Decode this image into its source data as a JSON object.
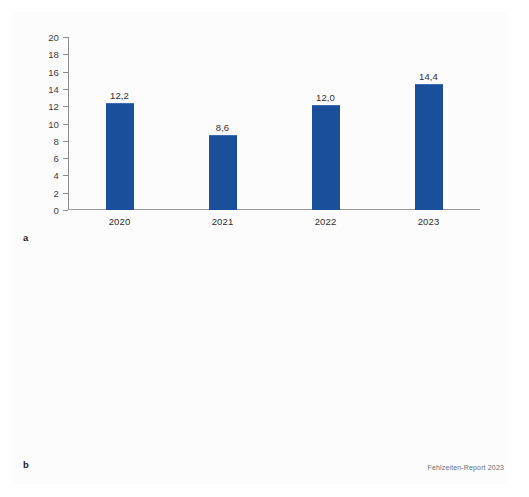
{
  "figure": {
    "source_note": "Fehlzeiten-Report 2023",
    "bar_color": "#1a4f9c",
    "axis_color": "#8e8e92",
    "text_color": "#2f2f33",
    "background": "#ffffff"
  },
  "panels": [
    {
      "letter": "a",
      "chart_data": {
        "type": "bar",
        "title": "",
        "xlabel": "",
        "ylabel": "",
        "categories": [
          "2020",
          "2021",
          "2022",
          "2023"
        ],
        "values": [
          12.2,
          8.6,
          12.0,
          14.4
        ],
        "value_labels": [
          "12,2",
          "8,6",
          "12,0",
          "14,4"
        ],
        "ylim": [
          0,
          20
        ],
        "ytick_step": 2,
        "ytick_labels": [
          "20",
          "18",
          "16",
          "14",
          "12",
          "10",
          "8",
          "6",
          "4",
          "2",
          "0"
        ],
        "grid": false,
        "legend": "none"
      }
    },
    {
      "letter": "b",
      "chart_data": {
        "type": "bar",
        "title": "",
        "xlabel": "",
        "ylabel": "",
        "categories": [
          "2020",
          "2021",
          "2022",
          "2023"
        ],
        "values": [
          16.0,
          14.6,
          17.2,
          17.2
        ],
        "value_labels": [
          "16,0",
          "14,6",
          "17,2",
          "17,2"
        ],
        "ylim": [
          0,
          20
        ],
        "ytick_step": 2,
        "ytick_labels": [
          "20",
          "18",
          "16",
          "14",
          "12",
          "10",
          "8",
          "6",
          "4",
          "2",
          "0"
        ],
        "grid": false,
        "legend": "none"
      }
    }
  ]
}
